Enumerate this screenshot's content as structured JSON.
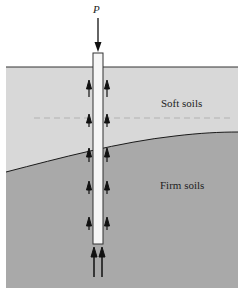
{
  "diagram": {
    "type": "pile foundation load transfer",
    "load": {
      "label": "P"
    },
    "layers": [
      {
        "name": "Soft soils",
        "color": "#d8d8d8"
      },
      {
        "name": "Firm soils",
        "color": "#a9a9a9"
      }
    ],
    "pile": {
      "color": "#f6f6f6",
      "outline": "#333333"
    },
    "shaft_friction_arrows_per_side": 5,
    "base_resistance_arrows": 2
  }
}
